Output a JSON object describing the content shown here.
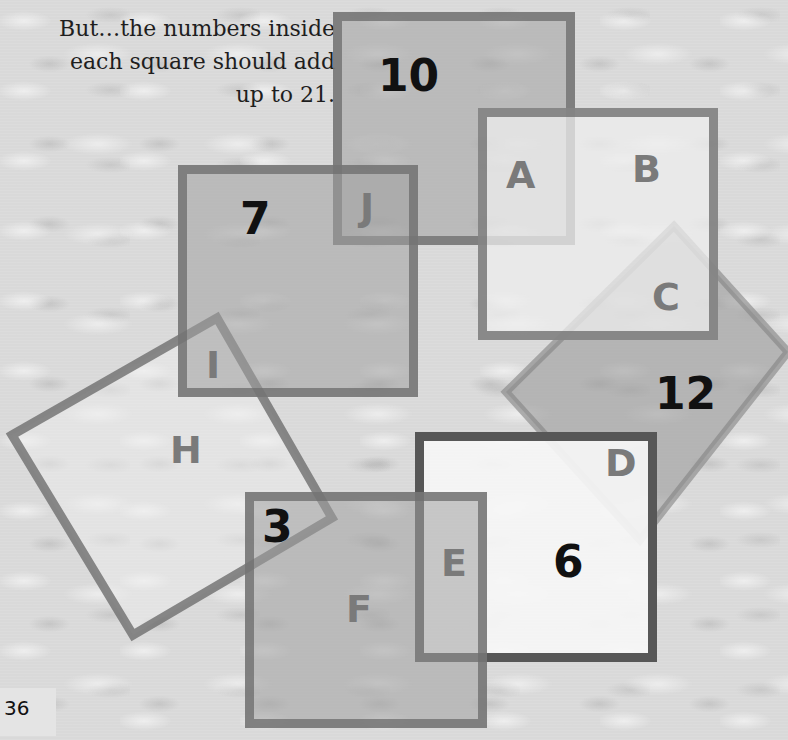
{
  "caption": {
    "lines": [
      "But…the numbers inside",
      "each square should add",
      "up to 21."
    ]
  },
  "puzzle": {
    "target_sum": 21,
    "squares": [
      {
        "id": "top",
        "given_number": "10",
        "letters": [
          "J",
          "A"
        ]
      },
      {
        "id": "upper-right",
        "given_number": "",
        "letters": [
          "A",
          "B",
          "C"
        ]
      },
      {
        "id": "left",
        "given_number": "7",
        "letters": [
          "J",
          "I"
        ]
      },
      {
        "id": "diamond",
        "given_number": "12",
        "letters": [
          "C",
          "D"
        ]
      },
      {
        "id": "tilted",
        "given_number": "",
        "letters": [
          "I",
          "H",
          "3"
        ]
      },
      {
        "id": "lower-right",
        "given_number": "6",
        "letters": [
          "D",
          "E"
        ]
      },
      {
        "id": "bottom",
        "given_number": "3",
        "letters": [
          "E",
          "F"
        ]
      }
    ],
    "numbers": {
      "n10": "10",
      "n7": "7",
      "n12": "12",
      "n6": "6",
      "n3": "3"
    },
    "letters": {
      "A": "A",
      "B": "B",
      "C": "C",
      "D": "D",
      "E": "E",
      "F": "F",
      "H": "H",
      "I": "I",
      "J": "J"
    }
  },
  "colors": {
    "border": "#6e6e6e",
    "fill_gray": "#a0a0a0",
    "letter": "#7a7a7a",
    "number": "#111111"
  },
  "page": {
    "number": "36"
  }
}
